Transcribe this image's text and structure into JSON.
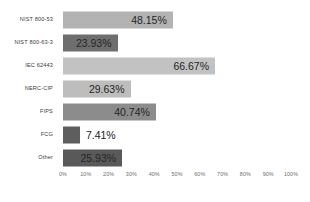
{
  "chart_data": {
    "type": "bar",
    "orientation": "horizontal",
    "title": "",
    "subtitle": "",
    "xlabel": "",
    "ylabel": "",
    "xlim": [
      0,
      100
    ],
    "grid": false,
    "legend": "none",
    "categories": [
      "NIST 800-53",
      "NIST 800-63-3",
      "IEC 62443",
      "NERC-CIP",
      "FIPS",
      "FCG",
      "Other"
    ],
    "values": [
      48.15,
      23.93,
      66.67,
      29.63,
      40.74,
      7.41,
      25.93
    ],
    "value_labels": [
      "48.15%",
      "23.93%",
      "66.67%",
      "29.63%",
      "40.74%",
      "7.41%",
      "25.93%"
    ],
    "label_placement": [
      "inside",
      "inside",
      "inside",
      "inside",
      "inside",
      "outside",
      "inside"
    ],
    "bar_colors": [
      "#b3b3b3",
      "#6e6e6e",
      "#c2c2c2",
      "#bdbdbd",
      "#8c8c8c",
      "#5e5e5e",
      "#595959"
    ],
    "xticks": [
      0,
      10,
      20,
      30,
      40,
      50,
      60,
      70,
      80,
      90,
      100
    ],
    "xtick_labels": [
      "0%",
      "10%",
      "20%",
      "30%",
      "40%",
      "50%",
      "60%",
      "70%",
      "80%",
      "90%",
      "100%"
    ],
    "background_color": "#ffffff",
    "tick_color": "#6e6e6e",
    "category_label_color": "#3b3b3b"
  }
}
